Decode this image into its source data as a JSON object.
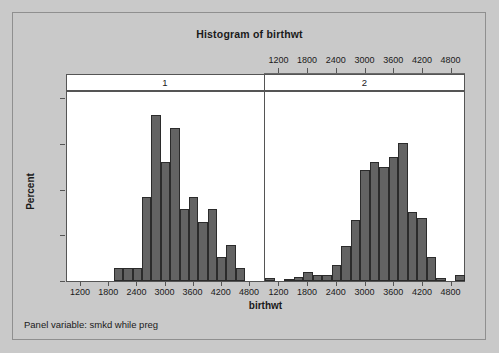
{
  "chart_data": {
    "type": "bar",
    "title": "Histogram of birthwt",
    "xlabel": "birthwt",
    "ylabel": "Percent",
    "ylim": [
      0,
      20.8
    ],
    "xlim": [
      900,
      5100
    ],
    "grid": false,
    "legend_position": "none",
    "panel_variable_note": "Panel variable: smkd while preg",
    "panel_variable": "smkd while preg",
    "bin_width": 200,
    "x_ticks": [
      1200,
      1800,
      2400,
      3000,
      3600,
      4200,
      4800
    ],
    "y_ticks": [
      0,
      5,
      10,
      15,
      20
    ],
    "top_axis_panels": [
      "2"
    ],
    "bar_color": "#636363",
    "bar_edge_color": "#2b2b2b",
    "background_color": "#c9c9c9",
    "plot_background_color": "#ffffff",
    "panels": [
      {
        "label": "1",
        "bin_centers": [
          1000,
          1200,
          1400,
          1600,
          1800,
          2000,
          2200,
          2400,
          2600,
          2800,
          3000,
          3200,
          3400,
          3600,
          3800,
          4000,
          4200,
          4400,
          4600,
          4800,
          5000
        ],
        "values": [
          0,
          0,
          0,
          0,
          0,
          1.4,
          1.4,
          1.4,
          9.2,
          18.2,
          13.0,
          16.8,
          7.9,
          9.2,
          6.5,
          7.9,
          2.6,
          3.9,
          1.4,
          0,
          0
        ]
      },
      {
        "label": "2",
        "bin_centers": [
          1000,
          1200,
          1400,
          1600,
          1800,
          2000,
          2200,
          2400,
          2600,
          2800,
          3000,
          3200,
          3400,
          3600,
          3800,
          4000,
          4200,
          4400,
          4600,
          4800,
          5000
        ],
        "values": [
          0.3,
          0,
          0.25,
          0.4,
          1.0,
          0.7,
          0.7,
          1.7,
          3.8,
          6.7,
          12.2,
          13.0,
          12.5,
          13.6,
          15.1,
          7.6,
          6.9,
          2.6,
          0.3,
          0,
          0.65
        ]
      }
    ]
  },
  "chart": {
    "title": "Histogram of birthwt",
    "y_axis_title": "Percent",
    "x_axis_title": "birthwt",
    "footer": "Panel variable: smkd while preg",
    "y_tick_labels": [
      "0",
      "5",
      "10",
      "15",
      "20"
    ],
    "x_tick_labels": [
      "1200",
      "1800",
      "2400",
      "3000",
      "3600",
      "4200",
      "4800"
    ],
    "panel_headers": [
      "1",
      "2"
    ]
  }
}
